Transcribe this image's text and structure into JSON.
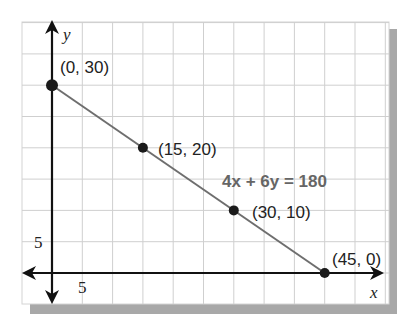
{
  "chart_data": {
    "type": "line",
    "title": "",
    "xlabel": "x",
    "ylabel": "y",
    "equation": "4x + 6y = 180",
    "xlim": [
      -5,
      55
    ],
    "ylim": [
      -5,
      40
    ],
    "grid": true,
    "grid_step": 5,
    "tick_labels": {
      "x": "5",
      "y": "5"
    },
    "series": [
      {
        "name": "4x + 6y = 180",
        "x": [
          0,
          15,
          30,
          45
        ],
        "y": [
          30,
          20,
          10,
          0
        ]
      }
    ],
    "points": [
      {
        "x": 0,
        "y": 30,
        "label": "(0, 30)"
      },
      {
        "x": 15,
        "y": 20,
        "label": "(15, 20)"
      },
      {
        "x": 30,
        "y": 10,
        "label": "(30, 10)"
      },
      {
        "x": 45,
        "y": 0,
        "label": "(45, 0)"
      }
    ],
    "colors": {
      "line": "#6e6e6e",
      "grid": "#cfcfcf",
      "axis": "#111111",
      "point": "#1a1a1a",
      "shadow": "#a8a8a8",
      "equation": "#666666"
    }
  }
}
